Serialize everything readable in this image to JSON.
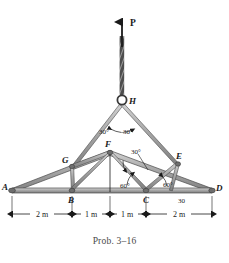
{
  "figure": {
    "caption": "Prob. 3–16",
    "load": {
      "label": "P",
      "direction": "up"
    },
    "colors": {
      "member_fill": "#b0b0b0",
      "member_stroke": "#4a4a4a",
      "chord_fill": "#9a9a9a",
      "line": "#1a1a1a",
      "caption": "#4a4a4a"
    },
    "nodes": [
      {
        "id": "A",
        "label": "A",
        "x": 12,
        "y": 190
      },
      {
        "id": "B",
        "label": "B",
        "x": 72,
        "y": 190
      },
      {
        "id": "C",
        "label": "C",
        "x": 146,
        "y": 190
      },
      {
        "id": "D",
        "label": "D",
        "x": 212,
        "y": 190
      },
      {
        "id": "E",
        "label": "E",
        "x": 178,
        "y": 163
      },
      {
        "id": "F",
        "label": "F",
        "x": 110,
        "y": 152
      },
      {
        "id": "G",
        "label": "G",
        "x": 72,
        "y": 166
      },
      {
        "id": "H",
        "label": "H",
        "x": 122,
        "y": 101
      }
    ],
    "angles": [
      {
        "label": "30°",
        "at": "H",
        "side": "left",
        "x": 106,
        "y": 130
      },
      {
        "label": "30°",
        "at": "H",
        "side": "right",
        "x": 128,
        "y": 130
      },
      {
        "label": "30°",
        "at": "F",
        "side": "right",
        "x": 137,
        "y": 155
      },
      {
        "label": "60°",
        "at": "C",
        "side": "left",
        "x": 129,
        "y": 186
      },
      {
        "label": "60°",
        "at": "C",
        "side": "right",
        "x": 168,
        "y": 186
      },
      {
        "label": "30",
        "at": "D",
        "side": "left",
        "x": 184,
        "y": 201
      }
    ],
    "dimensions": [
      {
        "label": "2 m",
        "from": "A",
        "to": "B"
      },
      {
        "label": "1 m",
        "from": "B",
        "to": "mid"
      },
      {
        "label": "1 m",
        "from": "mid",
        "to": "C"
      },
      {
        "label": "2 m",
        "from": "C",
        "to": "D"
      }
    ]
  }
}
